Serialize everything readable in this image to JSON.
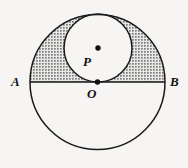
{
  "figure": {
    "background_color": "#f6f5f3",
    "stroke_color": "#1a1a1a",
    "shade_color": "#8a8a8a",
    "labels": {
      "A": "A",
      "B": "B",
      "P": "P",
      "O": "O"
    },
    "points": [
      {
        "name": "A",
        "label": "A",
        "x": 30,
        "y": 82
      },
      {
        "name": "B",
        "label": "B",
        "x": 165,
        "y": 82
      },
      {
        "name": "O",
        "label": "O",
        "x": 97.5,
        "y": 82
      },
      {
        "name": "P",
        "label": "P",
        "x": 98,
        "y": 48
      }
    ],
    "dots": [
      {
        "name": "center-dot-P",
        "x": 98,
        "y": 48,
        "r": 2.6
      },
      {
        "name": "center-dot-O",
        "x": 97.5,
        "y": 82,
        "r": 2.6
      }
    ],
    "shapes": [
      {
        "name": "large-circle",
        "type": "circle",
        "cx": 97.5,
        "cy": 82,
        "r": 67.5
      },
      {
        "name": "small-circle",
        "type": "circle",
        "cx": 98,
        "cy": 48,
        "r": 34
      },
      {
        "name": "diameter-AB",
        "type": "line",
        "x1": 30,
        "y1": 82,
        "x2": 165,
        "y2": 82
      }
    ],
    "shaded_region": {
      "name": "lune-region",
      "description": "Region bounded by upper-left arc of large circle, left arc of small circle, and segment AO",
      "fill": "stipple-gray"
    }
  }
}
